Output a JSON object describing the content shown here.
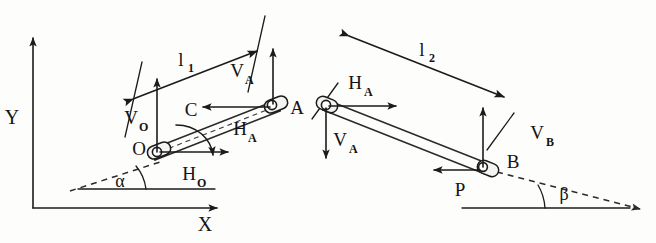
{
  "figure": {
    "background_color": "#fdfdfc",
    "ink_color": "#1b1b1b"
  },
  "axes": {
    "y_label": "Y",
    "x_label": "X"
  },
  "left_diagram": {
    "name": "bar-OA-free-body",
    "joints": [
      {
        "id": "O",
        "label": "O",
        "type": "pin-joint"
      },
      {
        "id": "A",
        "label": "A",
        "type": "pin-joint"
      }
    ],
    "dimension": {
      "label": "l",
      "subscript": "1"
    },
    "angle": {
      "label": "α",
      "name": "alpha"
    },
    "forces": [
      {
        "label": "V",
        "subscript": "O",
        "direction": "up",
        "at": "O"
      },
      {
        "label": "H",
        "subscript": "O",
        "direction": "right",
        "at": "O"
      },
      {
        "label": "V",
        "subscript": "A",
        "direction": "up",
        "at": "A"
      },
      {
        "label": "H",
        "subscript": "A",
        "direction": "left",
        "at": "A"
      }
    ],
    "moment": {
      "label": "C",
      "sense": "clockwise"
    }
  },
  "right_diagram": {
    "name": "bar-AB-free-body",
    "joints": [
      {
        "id": "A",
        "label": "A",
        "type": "pin-joint"
      },
      {
        "id": "B",
        "label": "B",
        "type": "pin-joint"
      }
    ],
    "dimension": {
      "label": "l",
      "subscript": "2"
    },
    "angle": {
      "label": "β",
      "name": "beta"
    },
    "forces": [
      {
        "label": "H",
        "subscript": "A",
        "direction": "right",
        "at": "A"
      },
      {
        "label": "V",
        "subscript": "A",
        "direction": "down",
        "at": "A"
      },
      {
        "label": "V",
        "subscript": "B",
        "direction": "up",
        "at": "B"
      },
      {
        "label": "P",
        "subscript": "",
        "direction": "left",
        "at": "B"
      }
    ]
  }
}
